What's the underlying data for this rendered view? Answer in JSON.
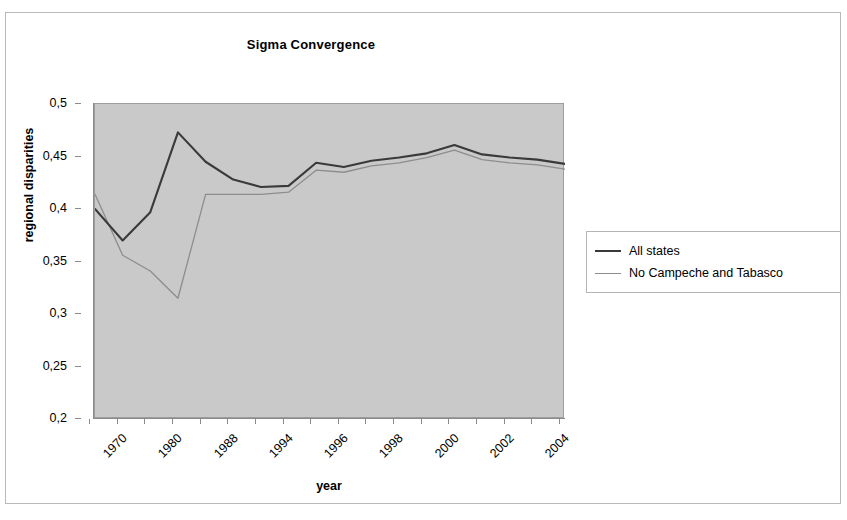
{
  "chart_data": {
    "type": "line",
    "title": "Sigma Convergence",
    "xlabel": "year",
    "ylabel": "regional disparities",
    "ylim": [
      0.2,
      0.5
    ],
    "ytick_labels": [
      "0,5",
      "0,45",
      "0,4",
      "0,35",
      "0,3",
      "0,25",
      "0,2"
    ],
    "ytick_values": [
      0.5,
      0.45,
      0.4,
      0.35,
      0.3,
      0.25,
      0.2
    ],
    "grid": false,
    "plot_background": "#c9c9c9",
    "legend_position": "right",
    "categories": [
      "1970",
      "1975",
      "1980",
      "1985",
      "1988",
      "1990",
      "1994",
      "1995",
      "1996",
      "1997",
      "1998",
      "1999",
      "2000",
      "2001",
      "2002",
      "2003",
      "2004",
      "2005"
    ],
    "xtick_labels": [
      "1970",
      "",
      "1980",
      "",
      "1988",
      "",
      "1994",
      "",
      "1996",
      "",
      "1998",
      "",
      "2000",
      "",
      "2002",
      "",
      "2004",
      ""
    ],
    "xtick_labels_visible": [
      "1970",
      "1980",
      "1988",
      "1994",
      "1996",
      "1998",
      "2000",
      "2002",
      "2004"
    ],
    "series": [
      {
        "name": "All states",
        "color": "#3a3a3a",
        "width": 2.1,
        "values": [
          0.4,
          0.37,
          0.397,
          0.473,
          0.445,
          0.428,
          0.421,
          0.422,
          0.444,
          0.44,
          0.446,
          0.449,
          0.453,
          0.461,
          0.452,
          0.449,
          0.447,
          0.443
        ]
      },
      {
        "name": "No Campeche and Tabasco",
        "color": "#8d8d8d",
        "width": 1.3,
        "values": [
          0.414,
          0.356,
          0.341,
          0.315,
          0.414,
          0.414,
          0.414,
          0.416,
          0.437,
          0.435,
          0.441,
          0.444,
          0.449,
          0.456,
          0.447,
          0.444,
          0.442,
          0.438
        ]
      }
    ]
  },
  "legend": {
    "items": [
      {
        "label": "All states",
        "color": "#3a3a3a",
        "width": "2.1px"
      },
      {
        "label": "No Campeche and Tabasco",
        "color": "#8d8d8d",
        "width": "1.3px"
      }
    ]
  }
}
